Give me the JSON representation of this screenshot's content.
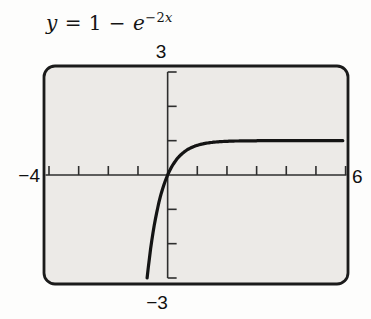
{
  "title": {
    "lhs": "y",
    "mid": " = 1 − ",
    "base": "e",
    "exp_num": "−2",
    "exp_var": "x"
  },
  "labels": {
    "ymax": "3",
    "xmin": "−4",
    "xmax": "6",
    "ymin": "−3"
  },
  "colors": {
    "screen_bg": "#eceae7",
    "screen_border": "#1b1b1b",
    "axis": "#2e2e2e",
    "curve": "#141414",
    "label_text": "#101010"
  },
  "chart_data": {
    "type": "line",
    "function": {
      "form": "y = a + b·exp(k·x)",
      "a": 1,
      "b": -1,
      "k": -2
    },
    "window": {
      "xmin": -4,
      "xmax": 6,
      "xscl": 1,
      "ymin": -3,
      "ymax": 3,
      "yscl": 1
    },
    "asymptote_y": 1,
    "x_intercept": 0,
    "curve_x_start": -0.6931,
    "curve_x_end": 5.92,
    "grid": "off",
    "legend": "none",
    "sample_points": [
      {
        "x": -0.69,
        "y": -3.0
      },
      {
        "x": -0.5,
        "y": -1.72
      },
      {
        "x": -0.25,
        "y": -0.65
      },
      {
        "x": 0,
        "y": 0
      },
      {
        "x": 0.25,
        "y": 0.39
      },
      {
        "x": 0.5,
        "y": 0.63
      },
      {
        "x": 1,
        "y": 0.86
      },
      {
        "x": 1.5,
        "y": 0.95
      },
      {
        "x": 2,
        "y": 0.98
      },
      {
        "x": 3,
        "y": 1.0
      },
      {
        "x": 4,
        "y": 1.0
      },
      {
        "x": 5,
        "y": 1.0
      },
      {
        "x": 6,
        "y": 1.0
      }
    ]
  }
}
